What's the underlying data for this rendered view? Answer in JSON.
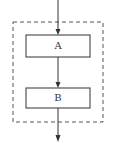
{
  "diagram": {
    "type": "flowchart",
    "blocks": [
      {
        "id": "A",
        "label": "A"
      },
      {
        "id": "B",
        "label": "B"
      }
    ],
    "edges": [
      {
        "from": "input",
        "to": "A"
      },
      {
        "from": "A",
        "to": "B"
      },
      {
        "from": "B",
        "to": "output"
      }
    ],
    "container": {
      "style": "dashed",
      "encloses": [
        "A",
        "B"
      ]
    },
    "colors": {
      "stroke": "#333333",
      "dashed": "#555555"
    }
  }
}
